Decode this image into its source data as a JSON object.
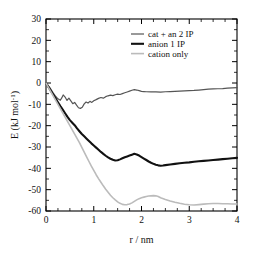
{
  "chart_data": {
    "type": "line",
    "title": "",
    "xlabel": "r / nm",
    "ylabel": "E (kJ mol-1)",
    "ylabel_base": "E (kJ mol",
    "ylabel_exp": "-1",
    "ylabel_tail": ")",
    "xlim": [
      0,
      4
    ],
    "ylim": [
      -60,
      30
    ],
    "xticks": [
      0,
      1,
      2,
      3,
      4
    ],
    "xticklabels": [
      "0",
      "1",
      "2",
      "3",
      "4"
    ],
    "yticks": [
      30,
      20,
      10,
      0,
      -10,
      -20,
      -30,
      -40,
      -50,
      -60
    ],
    "yticklabels": [
      "30",
      "20",
      "10",
      "0",
      "-10",
      "-20",
      "-30",
      "-40",
      "-50",
      "-60"
    ],
    "x_minor_interval": 0.25,
    "y_minor_interval": 5,
    "grid": false,
    "legend_position": "top-right",
    "series": [
      {
        "name": "cat + an 2 IP",
        "color": "#555555",
        "width": 1.2,
        "x": [
          0.0,
          0.08,
          0.15,
          0.2,
          0.25,
          0.3,
          0.33,
          0.36,
          0.4,
          0.44,
          0.48,
          0.52,
          0.56,
          0.6,
          0.64,
          0.68,
          0.72,
          0.76,
          0.8,
          0.84,
          0.88,
          0.92,
          0.96,
          1.0,
          1.05,
          1.1,
          1.15,
          1.2,
          1.25,
          1.3,
          1.35,
          1.4,
          1.45,
          1.5,
          1.55,
          1.6,
          1.65,
          1.7,
          1.75,
          1.8,
          1.85,
          1.9,
          1.95,
          2.0,
          2.05,
          2.1,
          2.2,
          2.3,
          2.4,
          2.5,
          2.6,
          2.7,
          2.8,
          2.9,
          3.0,
          3.1,
          3.2,
          3.3,
          3.4,
          3.5,
          3.6,
          3.7,
          3.8,
          3.9,
          4.0
        ],
        "y": [
          0.0,
          -2.2,
          -4.6,
          -6.2,
          -7.4,
          -8.1,
          -7.0,
          -5.6,
          -6.6,
          -8.2,
          -7.1,
          -8.4,
          -9.7,
          -9.1,
          -10.4,
          -11.6,
          -11.9,
          -11.4,
          -9.8,
          -8.9,
          -9.4,
          -8.6,
          -9.1,
          -8.3,
          -7.8,
          -7.2,
          -6.8,
          -7.1,
          -6.4,
          -6.0,
          -5.7,
          -5.9,
          -5.5,
          -5.2,
          -5.4,
          -5.0,
          -4.6,
          -4.2,
          -3.8,
          -3.4,
          -3.1,
          -3.3,
          -3.6,
          -3.9,
          -4.0,
          -4.1,
          -4.2,
          -4.2,
          -4.3,
          -4.1,
          -4.0,
          -3.9,
          -3.8,
          -3.7,
          -3.6,
          -3.5,
          -3.3,
          -3.1,
          -2.9,
          -2.8,
          -2.7,
          -2.6,
          -2.4,
          -2.3,
          -2.2
        ]
      },
      {
        "name": "anion 1 IP",
        "color": "#111111",
        "width": 2.1,
        "x": [
          0.0,
          0.05,
          0.1,
          0.15,
          0.2,
          0.25,
          0.3,
          0.35,
          0.4,
          0.45,
          0.5,
          0.55,
          0.6,
          0.65,
          0.7,
          0.75,
          0.8,
          0.85,
          0.9,
          0.95,
          1.0,
          1.05,
          1.1,
          1.15,
          1.2,
          1.25,
          1.3,
          1.35,
          1.4,
          1.45,
          1.5,
          1.55,
          1.6,
          1.65,
          1.7,
          1.75,
          1.8,
          1.85,
          1.9,
          1.95,
          2.0,
          2.05,
          2.1,
          2.15,
          2.2,
          2.25,
          2.3,
          2.35,
          2.4,
          2.45,
          2.5,
          2.6,
          2.7,
          2.8,
          2.9,
          3.0,
          3.1,
          3.2,
          3.3,
          3.4,
          3.5,
          3.6,
          3.7,
          3.8,
          3.9,
          4.0
        ],
        "y": [
          0.0,
          -1.8,
          -3.6,
          -5.4,
          -7.2,
          -9.0,
          -10.8,
          -12.5,
          -14.2,
          -15.9,
          -17.4,
          -18.6,
          -19.8,
          -21.3,
          -22.6,
          -23.9,
          -25.0,
          -26.1,
          -27.2,
          -28.3,
          -29.3,
          -30.3,
          -31.3,
          -32.3,
          -33.2,
          -34.1,
          -34.9,
          -35.5,
          -36.0,
          -36.3,
          -36.2,
          -35.8,
          -35.3,
          -34.8,
          -34.4,
          -34.0,
          -33.6,
          -33.2,
          -33.5,
          -34.0,
          -34.7,
          -35.4,
          -36.1,
          -36.8,
          -37.4,
          -37.9,
          -38.3,
          -38.6,
          -38.8,
          -38.7,
          -38.5,
          -38.2,
          -37.9,
          -37.6,
          -37.4,
          -37.2,
          -36.9,
          -36.7,
          -36.5,
          -36.3,
          -36.1,
          -35.9,
          -35.7,
          -35.5,
          -35.3,
          -35.1
        ]
      },
      {
        "name": "cation only",
        "color": "#bbbbbb",
        "width": 1.6,
        "x": [
          0.0,
          0.05,
          0.1,
          0.15,
          0.2,
          0.25,
          0.3,
          0.35,
          0.4,
          0.45,
          0.5,
          0.55,
          0.6,
          0.65,
          0.7,
          0.75,
          0.8,
          0.85,
          0.9,
          0.95,
          1.0,
          1.05,
          1.1,
          1.15,
          1.2,
          1.25,
          1.3,
          1.35,
          1.4,
          1.45,
          1.5,
          1.55,
          1.6,
          1.65,
          1.7,
          1.75,
          1.8,
          1.85,
          1.9,
          1.95,
          2.0,
          2.05,
          2.1,
          2.15,
          2.2,
          2.25,
          2.3,
          2.35,
          2.4,
          2.5,
          2.6,
          2.7,
          2.8,
          2.9,
          3.0,
          3.1,
          3.2,
          3.3,
          3.4,
          3.5,
          3.6,
          3.7,
          3.8,
          3.9,
          4.0
        ],
        "y": [
          0.0,
          -2.0,
          -4.0,
          -6.0,
          -8.0,
          -10.0,
          -12.0,
          -14.0,
          -16.0,
          -18.0,
          -20.0,
          -22.0,
          -24.0,
          -26.0,
          -28.0,
          -30.2,
          -32.4,
          -34.6,
          -36.8,
          -39.0,
          -41.0,
          -43.0,
          -44.8,
          -46.5,
          -48.2,
          -49.8,
          -51.2,
          -52.6,
          -53.8,
          -54.8,
          -55.7,
          -56.4,
          -56.9,
          -57.1,
          -57.0,
          -56.7,
          -56.2,
          -55.5,
          -54.8,
          -54.2,
          -53.8,
          -53.5,
          -53.2,
          -53.0,
          -52.9,
          -52.8,
          -52.9,
          -53.2,
          -53.8,
          -54.6,
          -55.3,
          -55.9,
          -56.4,
          -56.8,
          -57.1,
          -57.2,
          -57.0,
          -56.8,
          -56.6,
          -56.5,
          -56.5,
          -56.6,
          -56.6,
          -56.7,
          -56.7
        ]
      }
    ]
  },
  "legend": {
    "items": [
      {
        "label": "cat + an 2 IP"
      },
      {
        "label": "anion 1 IP"
      },
      {
        "label": "cation only"
      }
    ]
  }
}
